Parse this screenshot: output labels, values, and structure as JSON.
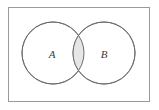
{
  "figure": {
    "kind": "venn-diagram",
    "caption": "",
    "universe_label": "",
    "background_color": "#ffffff",
    "canvas": {
      "width": 159,
      "height": 110
    }
  },
  "universal_set_box": {
    "name": "rectangle",
    "stroke_color": "#9a9a9a",
    "fill_color": "#ffffff",
    "x": 8.5,
    "y": 7.5,
    "width": 141,
    "height": 94
  },
  "sets": [
    {
      "id": "A",
      "label": "A",
      "cx": 53,
      "cy": 53,
      "r": 31,
      "stroke_color": "#6e6e6e",
      "fill_color": "#ffffff",
      "label_x": 52,
      "label_y": 54
    },
    {
      "id": "B",
      "label": "B",
      "cx": 104,
      "cy": 53,
      "r": 31,
      "stroke_color": "#6e6e6e",
      "fill_color": "#ffffff",
      "label_x": 104,
      "label_y": 54
    }
  ],
  "intersection": {
    "name": "A-intersect-B",
    "label": "",
    "shaded": true,
    "fill_color": "#e6e6e4",
    "stroke_color": "#6e6e6e"
  }
}
